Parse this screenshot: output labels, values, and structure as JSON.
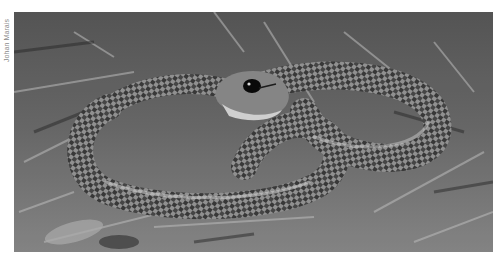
{
  "image": {
    "alt": "Grayscale photograph of a coiled snake with a dark eye and patterned scales resting on dry grass and leaf litter",
    "subject": "snake",
    "style": "black-and-white photograph"
  },
  "credit": {
    "text": "Johan Marais"
  },
  "colors": {
    "background": "#ffffff",
    "credit_text": "#8a8a8a"
  }
}
